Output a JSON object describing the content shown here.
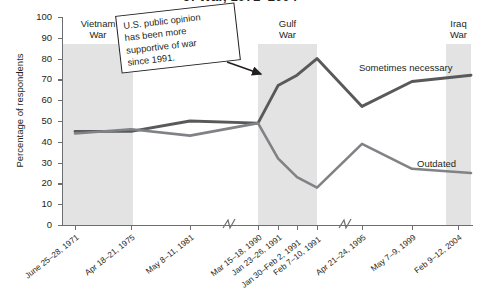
{
  "chart_data": {
    "type": "line",
    "title": "of War, 1971–2004",
    "xlabel": "",
    "ylabel": "Percentage of respondents",
    "ylim": [
      0,
      100
    ],
    "ytick_values": [
      0,
      10,
      20,
      30,
      40,
      50,
      60,
      70,
      80,
      90,
      100
    ],
    "grid": false,
    "legend": "inline-labels",
    "categories": [
      "June 25–28, 1971",
      "Apr 18–21, 1975",
      "May 8–11, 1981",
      "Mar 15–18, 1990",
      "Jan 23–26, 1991",
      "Jan 30–Feb 2, 1991",
      "Feb 7–10, 1991",
      "Apr 21–24, 1995",
      "May 7–9, 1999",
      "Feb 9–12, 2004"
    ],
    "series": [
      {
        "name": "Sometimes necessary",
        "values": [
          45,
          45,
          50,
          49,
          67,
          72,
          80,
          57,
          69,
          72
        ]
      },
      {
        "name": "Outdated",
        "values": [
          44,
          46,
          43,
          49,
          32,
          23,
          18,
          39,
          27,
          25
        ]
      }
    ],
    "axis_breaks": [
      "between May 8–11, 1981 and Mar 15–18, 1990",
      "between Feb 7–10, 1991 and Apr 21–24, 1995"
    ],
    "shaded_regions": [
      {
        "label": "Vietnam\nWar",
        "label_line1": "Vietnam",
        "label_line2": "War",
        "from": "June 25–28, 1971",
        "to": "Apr 18–21, 1975",
        "top_value": 90
      },
      {
        "label": "Gulf\nWar",
        "label_line1": "Gulf",
        "label_line2": "War",
        "from": "Jan 23–26, 1991",
        "to": "Feb 7–10, 1991",
        "top_value": 90
      },
      {
        "label": "Iraq\nWar",
        "label_line1": "Iraq",
        "label_line2": "War",
        "from": "Feb 9–12, 2004",
        "to": "Feb 9–12, 2004",
        "top_value": 90
      }
    ],
    "annotation": {
      "line1": "U.S. public opinion",
      "line2": "has been more",
      "line3": "supportive of war",
      "line4": "since 1991.",
      "points_to": "Gulf War"
    },
    "colors": {
      "series1": "#58595b",
      "series2": "#808285",
      "band": "#e3e3e3",
      "axis": "#6d6e71",
      "text": "#231f20"
    }
  },
  "yticks": {
    "t0": "0",
    "t10": "10",
    "t20": "20",
    "t30": "30",
    "t40": "40",
    "t50": "50",
    "t60": "60",
    "t70": "70",
    "t80": "80",
    "t90": "90",
    "t100": "100"
  },
  "xticks": {
    "x0": "June 25–28, 1971",
    "x1": "Apr 18–21, 1975",
    "x2": "May 8–11, 1981",
    "x3": "Mar 15–18, 1990",
    "x4": "Jan 23–26, 1991",
    "x5": "Jan 30–Feb 2, 1991",
    "x6": "Feb 7–10, 1991",
    "x7": "Apr 21–24, 1995",
    "x8": "May 7–9, 1999",
    "x9": "Feb 9–12, 2004"
  },
  "bands": {
    "vietnam_l1": "Vietnam",
    "vietnam_l2": "War",
    "gulf_l1": "Gulf",
    "gulf_l2": "War",
    "iraq_l1": "Iraq",
    "iraq_l2": "War"
  },
  "series_labels": {
    "sometimes": "Sometimes necessary",
    "outdated": "Outdated"
  },
  "annotation": {
    "line1": "U.S. public opinion",
    "line2": "has been more",
    "line3": "supportive of war",
    "line4": "since 1991."
  },
  "ylabel": "Percentage of respondents",
  "title": "of War, 1971–2004"
}
